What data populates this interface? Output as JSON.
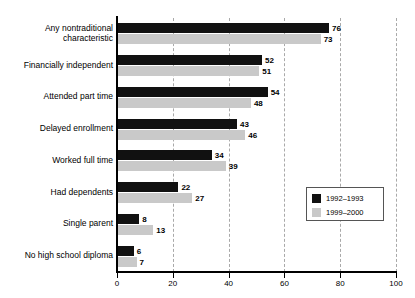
{
  "chart_data": {
    "type": "bar",
    "orientation": "horizontal",
    "title": "",
    "xlabel": "",
    "ylabel": "",
    "xlim": [
      0,
      100
    ],
    "xticks": [
      0,
      20,
      40,
      60,
      80,
      100
    ],
    "xtick_labels": [
      "0",
      "20",
      "40",
      "60",
      "80",
      "100"
    ],
    "grid": "vertical-dashed",
    "legend_position": "middle-right",
    "categories": [
      "Any nontraditional characteristic",
      "Financially independent",
      "Attended part time",
      "Delayed enrollment",
      "Worked full time",
      "Had dependents",
      "Single parent",
      "No high school diploma"
    ],
    "category_lines": [
      [
        "Any nontraditional",
        "characteristic"
      ],
      [
        "Financially independent"
      ],
      [
        "Attended part time"
      ],
      [
        "Delayed enrollment"
      ],
      [
        "Worked full time"
      ],
      [
        "Had dependents"
      ],
      [
        "Single parent"
      ],
      [
        "No high school diploma"
      ]
    ],
    "series": [
      {
        "name": "1992–1993",
        "color": "#111111",
        "values": [
          76,
          52,
          54,
          43,
          34,
          22,
          8,
          6
        ]
      },
      {
        "name": "1999–2000",
        "color": "#c9c9c9",
        "values": [
          73,
          51,
          48,
          46,
          39,
          27,
          13,
          7
        ]
      }
    ]
  },
  "legend": {
    "items": [
      {
        "label": "1992–1993",
        "color": "#111111"
      },
      {
        "label": "1999–2000",
        "color": "#c9c9c9"
      }
    ]
  }
}
